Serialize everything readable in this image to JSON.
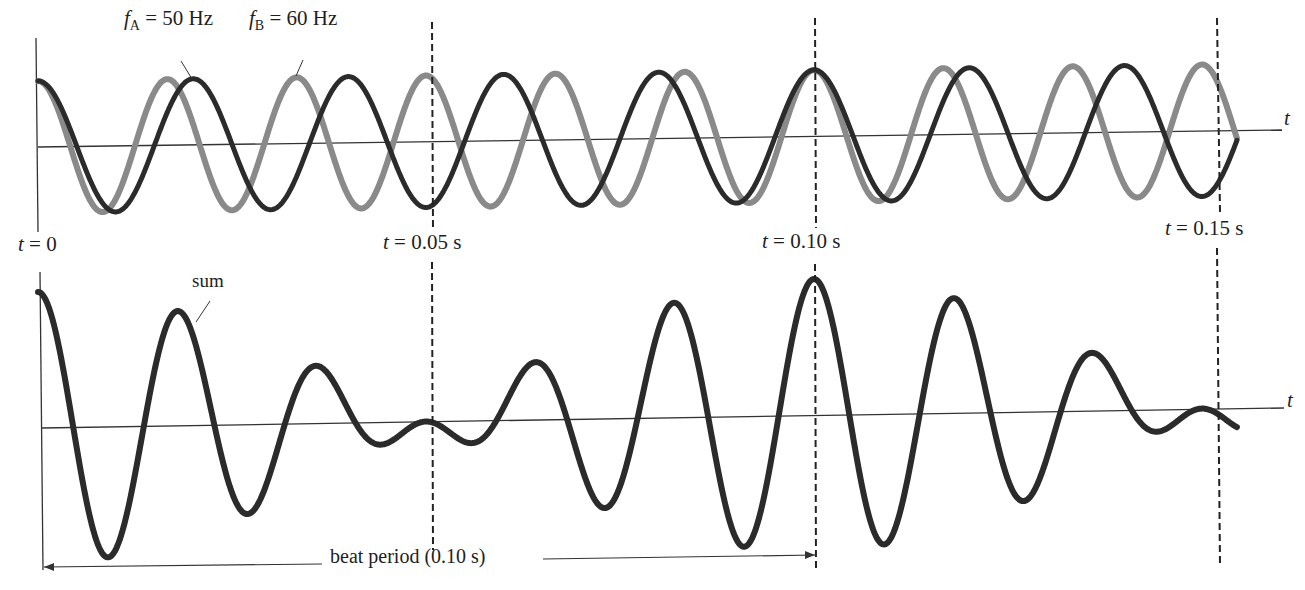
{
  "chart_data": {
    "type": "line",
    "panels": [
      {
        "name": "individual-waves",
        "series": [
          {
            "name": "f_A = 50 Hz",
            "frequency_hz": 50,
            "color": "#2b2b2b",
            "function": "cos(2*pi*50*t)"
          },
          {
            "name": "f_B = 60 Hz",
            "frequency_hz": 60,
            "color": "#8a8a8a",
            "function": "cos(2*pi*60*t)"
          }
        ],
        "xlabel": "t",
        "xlim_s": [
          0,
          0.155
        ],
        "ylim": [
          -1,
          1
        ]
      },
      {
        "name": "sum",
        "series": [
          {
            "name": "sum",
            "color": "#2b2b2b",
            "function": "cos(2*pi*50*t) + cos(2*pi*60*t)"
          }
        ],
        "xlabel": "t",
        "xlim_s": [
          0,
          0.155
        ],
        "ylim": [
          -2,
          2
        ]
      }
    ],
    "markers_s": [
      0,
      0.05,
      0.1,
      0.15
    ],
    "annotations": [
      "t = 0",
      "t = 0.05 s",
      "t = 0.10 s",
      "t = 0.15 s",
      "sum",
      "beat period (0.10 s)"
    ],
    "beat_period_s": 0.1
  },
  "labels": {
    "fa_symbol": "f",
    "fa_sub": "A",
    "fa_value": " = 50 Hz",
    "fb_symbol": "f",
    "fb_sub": "B",
    "fb_value": " = 60 Hz",
    "axis_t_top": "t",
    "axis_t_bottom": "t",
    "t0_sym": "t",
    "t0_val": " = 0",
    "t005_sym": "t",
    "t005_val": " = 0.05 s",
    "t010_sym": "t",
    "t010_val": " = 0.10 s",
    "t015_sym": "t",
    "t015_val": " = 0.15 s",
    "sum": "sum",
    "beat_period": "beat period (0.10 s)"
  },
  "layout": {
    "x0": 38,
    "px_per_s": 7760,
    "top_axis_y_left": 147,
    "top_axis_y_right": 130,
    "top_amp": 66,
    "bottom_axis_y_left": 428,
    "bottom_axis_y_right": 408,
    "bottom_amp": 68,
    "t_end": 0.1545,
    "dashed_x": [
      432,
      815,
      1217
    ],
    "colors": {
      "wave_a": "#2b2b2b",
      "wave_b": "#8a8a8a",
      "axis": "#333333"
    }
  }
}
